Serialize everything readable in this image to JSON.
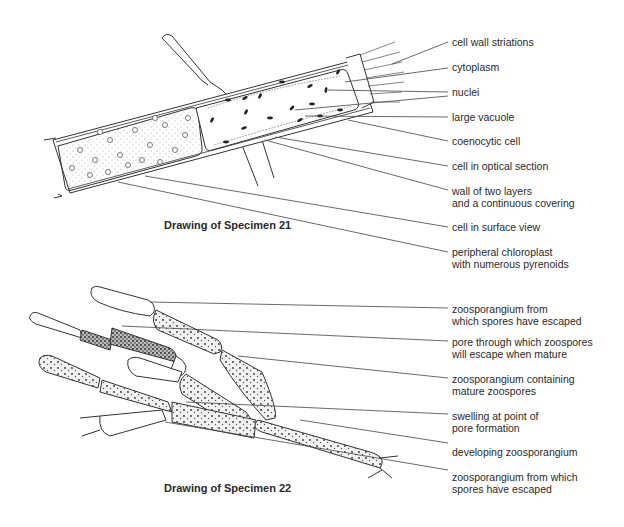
{
  "specimen21": {
    "caption": "Drawing of Specimen 21",
    "labels": [
      {
        "line1": "cell wall striations",
        "line2": ""
      },
      {
        "line1": "cytoplasm",
        "line2": ""
      },
      {
        "line1": "nuclei",
        "line2": ""
      },
      {
        "line1": "large vacuole",
        "line2": ""
      },
      {
        "line1": "coenocytic cell",
        "line2": ""
      },
      {
        "line1": "cell in optical section",
        "line2": ""
      },
      {
        "line1": "wall of two layers",
        "line2": "and a continuous covering"
      },
      {
        "line1": "cell in surface view",
        "line2": ""
      },
      {
        "line1": "peripheral chloroplast",
        "line2": "with numerous pyrenoids"
      }
    ]
  },
  "specimen22": {
    "caption": "Drawing of Specimen 22",
    "labels": [
      {
        "line1": "zoosporangium from",
        "line2": "which spores have escaped"
      },
      {
        "line1": "pore through which zoospores",
        "line2": "will escape when mature"
      },
      {
        "line1": "zoosporangium containing",
        "line2": "mature zoospores"
      },
      {
        "line1": "swelling at point of",
        "line2": "pore formation"
      },
      {
        "line1": "developing zoosporangium",
        "line2": ""
      },
      {
        "line1": "zoosporangium from which",
        "line2": "spores have escaped"
      }
    ]
  }
}
